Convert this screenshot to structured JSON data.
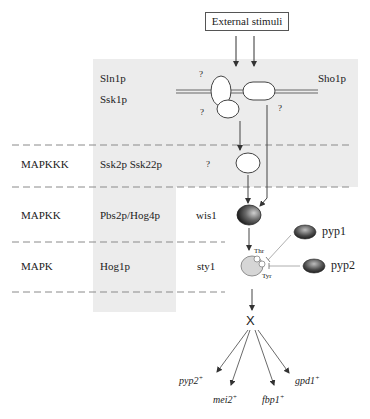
{
  "stimulus": {
    "label": "External stimuli"
  },
  "tiers": [
    {
      "name": "",
      "budding_yeast": [
        "Sln1p",
        "Ssk1p"
      ],
      "fission_yeast": ""
    },
    {
      "name": "MAPKKK",
      "budding_yeast": "Ssk2p Ssk22p",
      "fission_yeast": "?"
    },
    {
      "name": "MAPKK",
      "budding_yeast": "Pbs2p/Hog4p",
      "fission_yeast": "wis1"
    },
    {
      "name": "MAPK",
      "budding_yeast": "Hog1p",
      "fission_yeast": "sty1"
    }
  ],
  "membrane": {
    "sensor_right": "Sho1p",
    "unknowns": [
      "?",
      "?",
      "?"
    ]
  },
  "phosphorylation_sites": {
    "thr": "Thr",
    "tyr": "Tyr"
  },
  "phosphatases": [
    {
      "label": "pyp1"
    },
    {
      "label": "pyp2"
    }
  ],
  "transcription_factor": {
    "label": "X"
  },
  "target_genes": [
    {
      "label": "pyp2",
      "sup": "+"
    },
    {
      "label": "mei2",
      "sup": "+"
    },
    {
      "label": "fbp1",
      "sup": "+"
    },
    {
      "label": "gpd1",
      "sup": "+"
    }
  ],
  "colors": {
    "shade": "#ececec",
    "line": "#555555",
    "dash": "#8a8a8a",
    "kinase_dark": "#1a1a1a",
    "mapk_fill": "#d4d4d4"
  }
}
